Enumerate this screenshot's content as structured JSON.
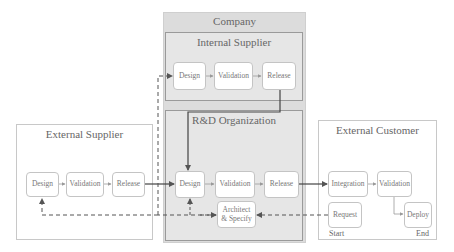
{
  "containers": {
    "company": {
      "title": "Company"
    },
    "internal_supplier": {
      "title": "Internal Supplier",
      "nodes": [
        "Design",
        "Validation",
        "Release"
      ]
    },
    "rnd_organization": {
      "title": "R&D Organization",
      "nodes": [
        "Design",
        "Validation",
        "Release"
      ],
      "architect": {
        "line1": "Architect",
        "line2": "& Specify"
      }
    },
    "external_supplier": {
      "title": "External Supplier",
      "nodes": [
        "Design",
        "Validation",
        "Release"
      ]
    },
    "external_customer": {
      "title": "External Customer",
      "nodes": [
        "Integration",
        "Validation",
        "Request",
        "Deploy"
      ],
      "start_label": "Start",
      "end_label": "End"
    }
  },
  "colors": {
    "company_fill": "#dcdcdc",
    "inner_fill": "#e6e6e6",
    "edge_solid": "#444444",
    "edge_dashed": "#555555"
  }
}
